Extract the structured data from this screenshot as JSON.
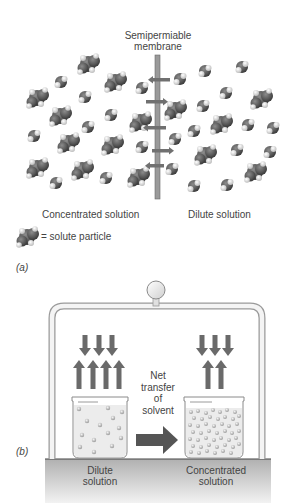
{
  "panel_a": {
    "membrane_label_line1": "Semipermiable",
    "membrane_label_line2": "membrane",
    "left_label": "Concentrated solution",
    "right_label": "Dilute solution",
    "legend_text": "= solute particle",
    "panel_label": "(a)",
    "membrane_arrows": [
      {
        "y": 80,
        "direction": "left"
      },
      {
        "y": 102,
        "direction": "right"
      },
      {
        "y": 128,
        "direction": "left"
      },
      {
        "y": 150,
        "direction": "right"
      },
      {
        "y": 166,
        "direction": "left"
      }
    ]
  },
  "panel_b": {
    "transfer_label_line1": "Net",
    "transfer_label_line2": "transfer",
    "transfer_label_line3": "of",
    "transfer_label_line4": "solvent",
    "left_beaker_label_line1": "Dilute",
    "left_beaker_label_line2": "solution",
    "right_beaker_label_line1": "Concentrated",
    "right_beaker_label_line2": "solution",
    "panel_label": "(b)",
    "left_arrows": {
      "down": 3,
      "up": 4
    },
    "right_arrows": {
      "down": 3,
      "up": 2
    }
  },
  "colors": {
    "molecule_dark": "#555555",
    "hydrogen": "#e8e8e8",
    "membrane": "#8a8a8a",
    "arrow": "#6a6a6a",
    "ground": "#bdbdbd",
    "solution": "#eeeeee"
  }
}
